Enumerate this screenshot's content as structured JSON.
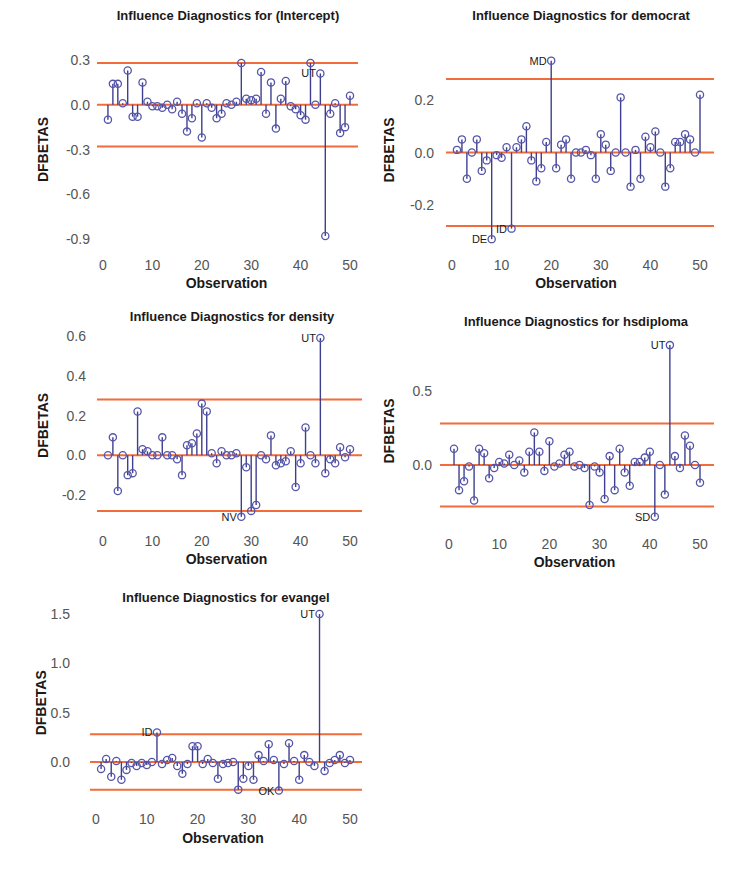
{
  "colors": {
    "stem": "#3f3f8f",
    "point": "#5555aa",
    "threshold": "#f26b3a",
    "text": "#1a1a1a",
    "tick": "#555555"
  },
  "chart_data": [
    {
      "type": "scatter",
      "subtype": "lollipop",
      "title": "Influence Diagnostics for (Intercept)",
      "xlabel": "Observation",
      "ylabel": "DFBETAS",
      "xticks": [
        0,
        10,
        20,
        30,
        40,
        50
      ],
      "yticks": [
        0.3,
        0.0,
        -0.3,
        -0.6,
        -0.9
      ],
      "ytick_labels": [
        "0.3",
        "0.0",
        "-0.3",
        "-0.6",
        "-0.9"
      ],
      "xlim": [
        0,
        51
      ],
      "ylim": [
        -0.92,
        0.32
      ],
      "thresholds": [
        0.28,
        0.0,
        -0.28
      ],
      "x": [
        1,
        2,
        3,
        4,
        5,
        6,
        7,
        8,
        9,
        10,
        11,
        12,
        13,
        14,
        15,
        16,
        17,
        18,
        19,
        20,
        21,
        22,
        23,
        24,
        25,
        26,
        27,
        28,
        29,
        30,
        31,
        32,
        33,
        34,
        35,
        36,
        37,
        38,
        39,
        40,
        41,
        42,
        43,
        44,
        45,
        46,
        47,
        48,
        49,
        50
      ],
      "values": [
        -0.1,
        0.14,
        0.14,
        0.01,
        0.23,
        -0.08,
        -0.08,
        0.15,
        0.02,
        -0.01,
        -0.01,
        -0.02,
        0.0,
        -0.03,
        0.02,
        -0.06,
        -0.18,
        -0.09,
        0.01,
        -0.22,
        0.01,
        -0.02,
        -0.09,
        -0.06,
        0.01,
        0.0,
        0.02,
        0.28,
        0.04,
        0.03,
        0.04,
        0.22,
        -0.06,
        0.15,
        -0.16,
        0.04,
        0.16,
        -0.01,
        -0.03,
        -0.07,
        -0.1,
        0.28,
        0.0,
        0.21,
        -0.88,
        -0.06,
        0.01,
        -0.19,
        -0.15,
        0.06
      ],
      "labels": [
        {
          "x": 44,
          "text": "UT"
        }
      ]
    },
    {
      "type": "scatter",
      "subtype": "lollipop",
      "title": "Influence Diagnostics for democrat",
      "xlabel": "Observation",
      "ylabel": "DFBETAS",
      "xticks": [
        0,
        10,
        20,
        30,
        40,
        50
      ],
      "yticks": [
        0.2,
        0.0,
        -0.2
      ],
      "ytick_labels": [
        "0.2",
        "0.0",
        "-0.2"
      ],
      "xlim": [
        0,
        51
      ],
      "ylim": [
        -0.34,
        0.36
      ],
      "thresholds": [
        0.28,
        0.0,
        -0.28
      ],
      "x": [
        1,
        2,
        3,
        4,
        5,
        6,
        7,
        8,
        9,
        10,
        11,
        12,
        13,
        14,
        15,
        16,
        17,
        18,
        19,
        20,
        21,
        22,
        23,
        24,
        25,
        26,
        27,
        28,
        29,
        30,
        31,
        32,
        33,
        34,
        35,
        36,
        37,
        38,
        39,
        40,
        41,
        42,
        43,
        44,
        45,
        46,
        47,
        48,
        49,
        50
      ],
      "values": [
        0.01,
        0.05,
        -0.1,
        0.0,
        0.05,
        -0.07,
        -0.03,
        -0.33,
        -0.01,
        -0.02,
        0.02,
        -0.29,
        0.02,
        0.05,
        0.1,
        -0.03,
        -0.11,
        -0.06,
        0.04,
        0.35,
        -0.06,
        0.03,
        0.05,
        -0.1,
        0.0,
        0.0,
        0.01,
        -0.01,
        -0.1,
        0.07,
        0.03,
        -0.07,
        0.0,
        0.21,
        0.0,
        -0.13,
        0.01,
        -0.1,
        0.06,
        0.02,
        0.08,
        0.0,
        -0.13,
        -0.06,
        0.04,
        0.04,
        0.07,
        0.05,
        0.0,
        0.22
      ],
      "labels": [
        {
          "x": 20,
          "text": "MD"
        },
        {
          "x": 8,
          "text": "DE"
        },
        {
          "x": 12,
          "text": "ID"
        }
      ]
    },
    {
      "type": "scatter",
      "subtype": "lollipop",
      "title": "Influence Diagnostics for density",
      "xlabel": "Observation",
      "ylabel": "DFBETAS",
      "xticks": [
        0,
        10,
        20,
        30,
        40,
        50
      ],
      "yticks": [
        0.6,
        0.4,
        0.2,
        0.0,
        -0.2
      ],
      "ytick_labels": [
        "0.6",
        "0.4",
        "0.2",
        "0.0",
        "-0.2"
      ],
      "xlim": [
        0,
        51
      ],
      "ylim": [
        -0.32,
        0.62
      ],
      "thresholds": [
        0.28,
        0.0,
        -0.28
      ],
      "x": [
        1,
        2,
        3,
        4,
        5,
        6,
        7,
        8,
        9,
        10,
        11,
        12,
        13,
        14,
        15,
        16,
        17,
        18,
        19,
        20,
        21,
        22,
        23,
        24,
        25,
        26,
        27,
        28,
        29,
        30,
        31,
        32,
        33,
        34,
        35,
        36,
        37,
        38,
        39,
        40,
        41,
        42,
        43,
        44,
        45,
        46,
        47,
        48,
        49,
        50
      ],
      "values": [
        0.0,
        0.09,
        -0.18,
        0.0,
        -0.1,
        -0.09,
        0.22,
        0.03,
        0.02,
        0.0,
        0.0,
        0.09,
        0.0,
        0.0,
        -0.02,
        -0.1,
        0.05,
        0.06,
        0.11,
        0.26,
        0.22,
        0.01,
        -0.04,
        0.02,
        0.0,
        0.0,
        0.01,
        -0.31,
        -0.06,
        -0.28,
        -0.25,
        0.0,
        -0.02,
        0.1,
        -0.05,
        -0.04,
        -0.03,
        0.02,
        -0.16,
        -0.04,
        0.14,
        0.0,
        -0.04,
        0.59,
        -0.09,
        -0.02,
        -0.04,
        0.04,
        -0.01,
        0.03
      ],
      "labels": [
        {
          "x": 44,
          "text": "UT"
        },
        {
          "x": 28,
          "text": "NV"
        }
      ]
    },
    {
      "type": "scatter",
      "subtype": "lollipop",
      "title": "Influence Diagnostics for hsdiploma",
      "xlabel": "Observation",
      "ylabel": "DFBETAS",
      "xticks": [
        0,
        10,
        20,
        30,
        40,
        50
      ],
      "yticks": [
        0.5,
        0.0
      ],
      "ytick_labels": [
        "0.5",
        "0.0"
      ],
      "xlim": [
        0,
        51
      ],
      "ylim": [
        -0.36,
        0.82
      ],
      "thresholds": [
        0.28,
        0.0,
        -0.28
      ],
      "x": [
        1,
        2,
        3,
        4,
        5,
        6,
        7,
        8,
        9,
        10,
        11,
        12,
        13,
        14,
        15,
        16,
        17,
        18,
        19,
        20,
        21,
        22,
        23,
        24,
        25,
        26,
        27,
        28,
        29,
        30,
        31,
        32,
        33,
        34,
        35,
        36,
        37,
        38,
        39,
        40,
        41,
        42,
        43,
        44,
        45,
        46,
        47,
        48,
        49,
        50
      ],
      "values": [
        0.11,
        -0.17,
        -0.11,
        -0.01,
        -0.24,
        0.11,
        0.08,
        -0.09,
        -0.02,
        0.02,
        0.01,
        0.07,
        0.0,
        0.03,
        -0.05,
        0.09,
        0.22,
        0.09,
        -0.04,
        0.16,
        -0.01,
        0.01,
        0.07,
        0.09,
        -0.01,
        0.0,
        -0.02,
        -0.27,
        -0.01,
        -0.05,
        -0.23,
        0.06,
        -0.17,
        0.11,
        -0.05,
        -0.14,
        0.02,
        0.02,
        0.05,
        0.09,
        -0.35,
        0.0,
        -0.2,
        0.81,
        0.06,
        -0.02,
        0.2,
        0.13,
        0.0,
        -0.12
      ],
      "labels": [
        {
          "x": 44,
          "text": "UT"
        },
        {
          "x": 41,
          "text": "SD"
        }
      ]
    },
    {
      "type": "scatter",
      "subtype": "lollipop",
      "title": "Influence Diagnostics for evangel",
      "xlabel": "Observation",
      "ylabel": "DFBETAS",
      "xticks": [
        0,
        10,
        20,
        30,
        40,
        50
      ],
      "yticks": [
        1.5,
        1.0,
        0.5,
        0.0
      ],
      "ytick_labels": [
        "1.5",
        "1.0",
        "0.5",
        "0.0"
      ],
      "xlim": [
        0,
        51
      ],
      "ylim": [
        -0.32,
        1.52
      ],
      "thresholds": [
        0.28,
        0.0,
        -0.28
      ],
      "x": [
        1,
        2,
        3,
        4,
        5,
        6,
        7,
        8,
        9,
        10,
        11,
        12,
        13,
        14,
        15,
        16,
        17,
        18,
        19,
        20,
        21,
        22,
        23,
        24,
        25,
        26,
        27,
        28,
        29,
        30,
        31,
        32,
        33,
        34,
        35,
        36,
        37,
        38,
        39,
        40,
        41,
        42,
        43,
        44,
        45,
        46,
        47,
        48,
        49,
        50
      ],
      "values": [
        -0.07,
        0.03,
        -0.15,
        0.01,
        -0.18,
        -0.08,
        -0.01,
        -0.04,
        -0.01,
        -0.03,
        0.0,
        0.3,
        -0.02,
        0.02,
        0.04,
        -0.04,
        -0.12,
        -0.02,
        0.16,
        0.16,
        -0.02,
        0.03,
        -0.01,
        -0.17,
        -0.02,
        -0.01,
        0.0,
        -0.28,
        -0.17,
        -0.04,
        -0.18,
        0.07,
        0.01,
        0.18,
        0.02,
        -0.29,
        -0.02,
        0.19,
        0.01,
        -0.18,
        0.07,
        0.0,
        -0.04,
        1.5,
        -0.09,
        -0.01,
        0.02,
        0.07,
        -0.01,
        0.02
      ],
      "labels": [
        {
          "x": 44,
          "text": "UT"
        },
        {
          "x": 12,
          "text": "ID"
        },
        {
          "x": 36,
          "text": "OK"
        }
      ]
    }
  ]
}
